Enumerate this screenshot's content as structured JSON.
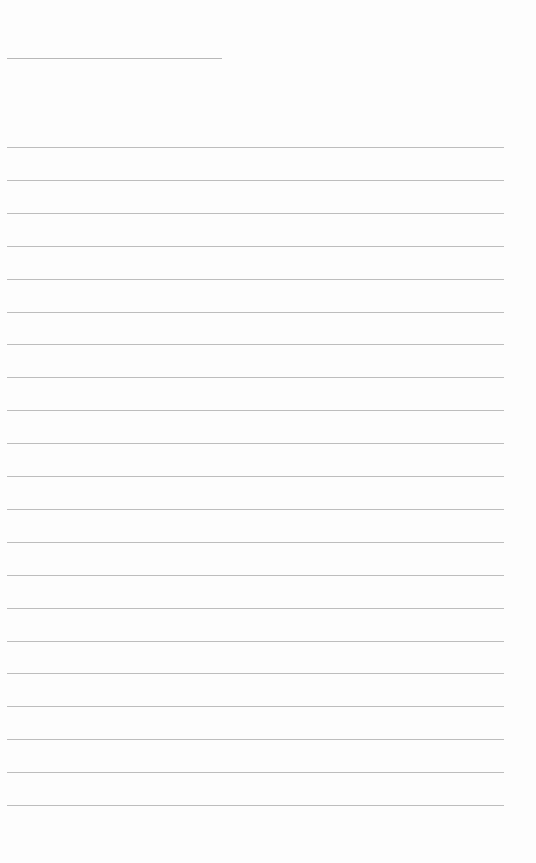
{
  "page": {
    "type": "blank-lined-page",
    "title_line": {
      "text": ""
    },
    "ruled_line_count": 21,
    "lines": [
      "",
      "",
      "",
      "",
      "",
      "",
      "",
      "",
      "",
      "",
      "",
      "",
      "",
      "",
      "",
      "",
      "",
      "",
      "",
      "",
      ""
    ]
  }
}
